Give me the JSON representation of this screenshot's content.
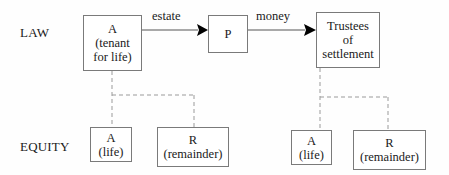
{
  "diagram": {
    "rows": {
      "law": "LAW",
      "equity": "EQUITY"
    },
    "law_nodes": {
      "a_tenant": {
        "line1": "A",
        "line2": "(tenant",
        "line3": "for life)"
      },
      "p": {
        "line1": "P"
      },
      "trustees": {
        "line1": "Trustees",
        "line2": "of",
        "line3": "settlement"
      }
    },
    "edges": {
      "a_to_p": "estate",
      "p_to_trustees": "money"
    },
    "equity_left": {
      "a_life": {
        "line1": "A",
        "line2": "(life)"
      },
      "r_remainder": {
        "line1": "R",
        "line2": "(remainder)"
      }
    },
    "equity_right": {
      "a_life": {
        "line1": "A",
        "line2": "(life)"
      },
      "r_remainder": {
        "line1": "R",
        "line2": "(remainder)"
      }
    },
    "colors": {
      "box_border": "#7a7a7a",
      "solid_line": "#555555",
      "dashed_line": "#9a9a9a",
      "arrowhead": "#000000",
      "text": "#1a1a1a"
    }
  }
}
